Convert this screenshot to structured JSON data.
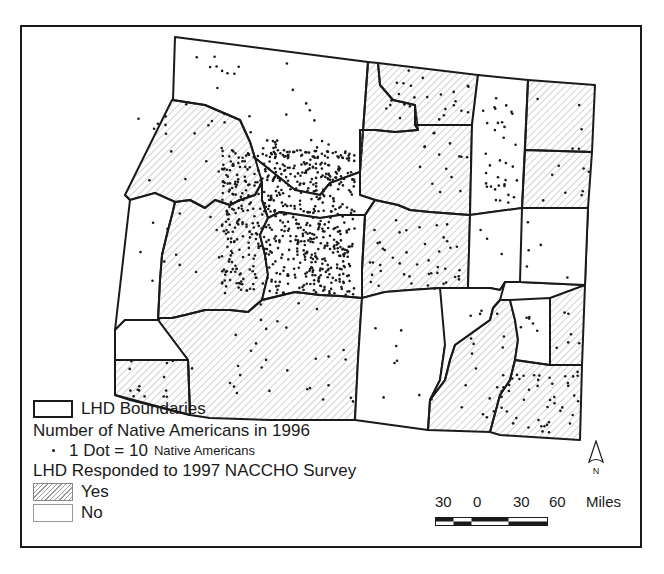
{
  "map": {
    "type": "choropleth-dot-density",
    "region_count": 23,
    "colors": {
      "boundary": "#1a1a1a",
      "hatch": "#9a9a9a",
      "dot": "#1a1a1a",
      "background": "#ffffff"
    }
  },
  "legend": {
    "boundary_label": "LHD Boundaries",
    "dot_title": "Number of Native Americans in 1996",
    "dot_value": "1 Dot = 10",
    "dot_unit": "Native Americans",
    "response_title": "LHD Responded to 1997 NACCHO Survey",
    "yes_label": "Yes",
    "no_label": "No"
  },
  "scale_bar": {
    "ticks": [
      "30",
      "0",
      "30",
      "60"
    ],
    "unit": "Miles"
  },
  "north_arrow": {
    "label": "N"
  }
}
